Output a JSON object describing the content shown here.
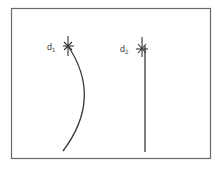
{
  "diagram": {
    "frame": {
      "x": 11,
      "y": 8,
      "width": 199,
      "height": 151,
      "stroke": "#6a6a6a"
    },
    "stroke_color": "#3a3a3a",
    "elements": [
      {
        "id": "d1",
        "label_base": "d",
        "label_sub": "1",
        "type": "curved-path",
        "marker": {
          "x": 68,
          "y": 47
        },
        "path": "M68,47 Q100,100 63,151"
      },
      {
        "id": "d2",
        "label_base": "d",
        "label_sub": "2",
        "type": "straight-line",
        "marker": {
          "x": 142,
          "y": 49
        },
        "path": "M145,47 L145,152"
      }
    ]
  }
}
